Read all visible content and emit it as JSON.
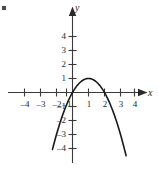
{
  "chart_data": {
    "type": "line",
    "title": "",
    "subtitle": "",
    "xlabel": "x",
    "ylabel": "y",
    "xlim": [
      -4.6,
      5.0
    ],
    "ylim": [
      -5.2,
      5.2
    ],
    "grid": false,
    "legend": null,
    "annotations": [],
    "x_ticks": [
      -4,
      -3,
      -2,
      -1,
      1,
      2,
      3,
      4
    ],
    "x_tick_labels": [
      "–4",
      "–3",
      "–2",
      "–1",
      "1",
      "2",
      "3",
      "4"
    ],
    "y_ticks": [
      4,
      3,
      2,
      1,
      -1,
      -2,
      -3,
      -4
    ],
    "y_tick_labels": [
      "4",
      "3",
      "2",
      "1",
      "–1",
      "–2",
      "–3",
      "–4"
    ],
    "series": [
      {
        "name": "parabola",
        "equation": "y = -x^2 + 2x",
        "vertex": [
          1,
          1
        ],
        "roots": [
          0,
          2
        ],
        "opens": "down",
        "color": "#1a1a1a",
        "x": [
          -1.2,
          -0.9,
          -0.6,
          -0.3,
          0.0,
          0.3,
          0.6,
          0.9,
          1.0,
          1.2,
          1.5,
          1.8,
          2.1,
          2.4,
          2.7,
          3.0,
          3.3
        ],
        "y": [
          -3.84,
          -2.61,
          -1.56,
          -0.69,
          0.0,
          0.51,
          0.84,
          0.99,
          1.0,
          0.96,
          0.75,
          0.36,
          -0.21,
          -0.96,
          -1.89,
          -3.0,
          -4.29
        ]
      }
    ]
  },
  "axes": {
    "x_axis_label": "x",
    "y_axis_label": "y",
    "x_axis_arrow": "arrow-right-icon",
    "y_axis_arrow": "arrow-up-icon"
  },
  "colors": {
    "axis": "#3a3a3a",
    "curve": "#1a1a1a",
    "text": "#2a2a2a",
    "background": "#ffffff"
  }
}
